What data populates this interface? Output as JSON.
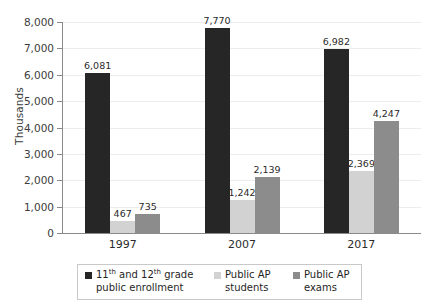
{
  "chart_data": {
    "type": "bar",
    "title": "",
    "subtitle": "",
    "xlabel": "",
    "ylabel": "Thousands",
    "categories": [
      "1997",
      "2007",
      "2017"
    ],
    "series": [
      {
        "name": "11th and 12th grade public enrollment",
        "legend_prefix": "11",
        "legend_sup1": "th",
        "legend_mid": " and 12",
        "legend_sup2": "th",
        "legend_suffix": " grade public enrollment",
        "color": "#262626",
        "values": [
          6081,
          6982,
          6982
        ],
        "labels": [
          "6,081",
          "7,770",
          "6,982"
        ]
      },
      {
        "name": "Public AP students",
        "color": "#d2d2d2",
        "values": [
          467,
          1242,
          2369
        ],
        "labels": [
          "467",
          "1,242",
          "2,369"
        ]
      },
      {
        "name": "Public AP exams",
        "color": "#8c8c8c",
        "values": [
          735,
          2139,
          4247
        ],
        "labels": [
          "735",
          "2,139",
          "4,247"
        ]
      }
    ],
    "values_by_group": [
      [
        6081,
        467,
        735
      ],
      [
        7770,
        1242,
        2139
      ],
      [
        6982,
        2369,
        4247
      ]
    ],
    "ylim": [
      0,
      8000
    ],
    "ytick_values": [
      0,
      1000,
      2000,
      3000,
      4000,
      5000,
      6000,
      7000,
      8000
    ],
    "ytick_labels": [
      "0",
      "1,000",
      "2,000",
      "3,000",
      "4,000",
      "5,000",
      "6,000",
      "7,000",
      "8,000"
    ],
    "grid": true,
    "grid_axis": "y",
    "legend_position": "bottom"
  },
  "legend": {
    "items": [
      {
        "label": "11th and 12th grade public enrollment",
        "color": "#262626"
      },
      {
        "label": "Public AP students",
        "color": "#d2d2d2"
      },
      {
        "label": "Public AP exams",
        "color": "#8c8c8c"
      }
    ],
    "item2_label": "Public AP students",
    "item3_label": "Public AP exams"
  }
}
